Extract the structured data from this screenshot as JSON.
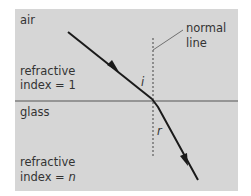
{
  "diagram": {
    "regions": {
      "air": {
        "label": "air",
        "ri_label_line1": "refractive",
        "ri_label_line2": "index = 1"
      },
      "glass": {
        "label": "glass",
        "ri_label_line1": "refractive",
        "ri_label_line2_prefix": "index = ",
        "ri_symbol": "n"
      }
    },
    "normal_label_line1": "normal",
    "normal_label_line2": "line",
    "angle_incidence": "i",
    "angle_refraction": "r",
    "colors": {
      "background": "#d6d6d6",
      "ray": "#1a1a1a",
      "boundary": "#555555"
    }
  }
}
